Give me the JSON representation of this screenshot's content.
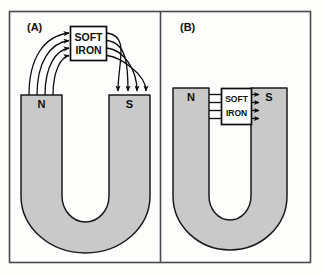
{
  "figure": {
    "frame": {
      "border_color": "#4a4a4a",
      "background": "#fdfdfc"
    },
    "colors": {
      "magnet_fill": "#c9c9c9",
      "magnet_stroke": "#1a1a1a",
      "box_fill": "#ffffff",
      "box_stroke": "#0d0d0d",
      "field_line": "#0d0d0d",
      "text": "#101010"
    }
  },
  "panels": [
    {
      "id": "panel-a",
      "label": "(A)",
      "magnet": {
        "type": "horseshoe",
        "left_pole_label": "N",
        "right_pole_label": "S"
      },
      "keeper_box": {
        "line1": "SOFT",
        "line2": "IRON",
        "position": "raised above poles"
      },
      "field_lines": {
        "count": 4,
        "description": "curved arcs from N pole up into soft iron, and out of soft iron down into S pole",
        "arrow_direction_left": "into-box",
        "arrow_direction_right": "into-s-pole"
      }
    },
    {
      "id": "panel-b",
      "label": "(B)",
      "magnet": {
        "type": "horseshoe",
        "left_pole_label": "N",
        "right_pole_label": "S"
      },
      "keeper_box": {
        "line1": "SOFT",
        "line2": "IRON",
        "position": "bridging the poles directly"
      },
      "field_lines": {
        "count": 4,
        "description": "short straight segments from N pole into soft iron and from soft iron into S pole",
        "arrow_direction_left": "into-box",
        "arrow_direction_right": "into-s-pole"
      }
    }
  ]
}
